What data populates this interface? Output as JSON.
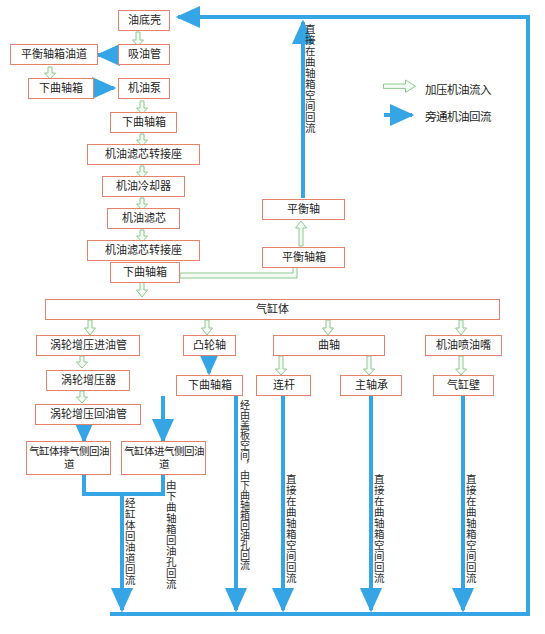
{
  "diagram": {
    "colors": {
      "box_border": "#e5826b",
      "green_arrow": "#8cc98c",
      "green_arrow_fill": "#f2faf2",
      "blue_arrow": "#35a5e5",
      "text": "#232323",
      "background": "#ffffff"
    },
    "legend": [
      {
        "id": "legend-green",
        "label": "加压机油流入",
        "style": "green-hollow-arrow"
      },
      {
        "id": "legend-blue",
        "label": "旁通机油回流",
        "style": "blue-solid-arrow"
      }
    ],
    "nodes": [
      {
        "id": "oil-pan",
        "label": "油底壳"
      },
      {
        "id": "balance-oil-duct",
        "label": "平衡轴箱油道"
      },
      {
        "id": "suction-pipe",
        "label": "吸油管"
      },
      {
        "id": "lower-crankcase-1",
        "label": "下曲轴箱"
      },
      {
        "id": "oil-pump",
        "label": "机油泵"
      },
      {
        "id": "lower-crankcase-2",
        "label": "下曲轴箱"
      },
      {
        "id": "filter-adapter-1",
        "label": "机油滤芯转接座"
      },
      {
        "id": "oil-cooler",
        "label": "机油冷却器"
      },
      {
        "id": "oil-filter",
        "label": "机油滤芯"
      },
      {
        "id": "filter-adapter-2",
        "label": "机油滤芯转接座"
      },
      {
        "id": "lower-crankcase-3",
        "label": "下曲轴箱"
      },
      {
        "id": "balance-shaft",
        "label": "平衡轴"
      },
      {
        "id": "balance-shaft-case",
        "label": "平衡轴箱"
      },
      {
        "id": "cylinder-block",
        "label": "气缸体"
      },
      {
        "id": "turbo-inlet-pipe",
        "label": "涡轮增压进油管"
      },
      {
        "id": "turbocharger",
        "label": "涡轮增压器"
      },
      {
        "id": "turbo-return-pipe",
        "label": "涡轮增压回油管"
      },
      {
        "id": "exhaust-side-duct",
        "label": "气缸体排气侧回油道"
      },
      {
        "id": "intake-side-duct",
        "label": "气缸体进气侧回油道"
      },
      {
        "id": "camshaft",
        "label": "凸轮轴"
      },
      {
        "id": "lower-crankcase-4",
        "label": "下曲轴箱"
      },
      {
        "id": "crankshaft",
        "label": "曲轴"
      },
      {
        "id": "conrod",
        "label": "连杆"
      },
      {
        "id": "main-bearing",
        "label": "主轴承"
      },
      {
        "id": "oil-jet",
        "label": "机油喷油嘴"
      },
      {
        "id": "cylinder-wall",
        "label": "气缸壁"
      }
    ],
    "return_labels": [
      {
        "id": "return-balance-shaft",
        "text": "直接在曲轴箱空间回流"
      },
      {
        "id": "return-block-duct",
        "text": "经缸体回油道回流"
      },
      {
        "id": "return-camshaft",
        "text": "经由盖板空间，由下曲轴箱回油孔回流"
      },
      {
        "id": "return-lower-case",
        "text": "由下曲轴箱回油孔回流"
      },
      {
        "id": "return-conrod",
        "text": "直接在曲轴箱空间回流"
      },
      {
        "id": "return-main-bearing",
        "text": "直接在曲轴箱空间回流"
      },
      {
        "id": "return-cylinder-wall",
        "text": "直接在曲轴箱空间回流"
      }
    ]
  }
}
